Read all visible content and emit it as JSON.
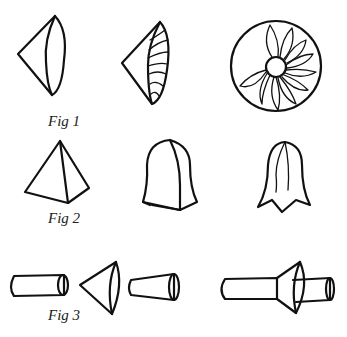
{
  "figures": [
    {
      "id": "fig1",
      "caption": "Fig 1",
      "parts": [
        "cone",
        "cone-with-petals",
        "flower-disc"
      ]
    },
    {
      "id": "fig2",
      "caption": "Fig 2",
      "parts": [
        "pyramid",
        "bell-blank",
        "bell-cut"
      ]
    },
    {
      "id": "fig3",
      "caption": "Fig 3",
      "parts": [
        "cylinder",
        "cone",
        "tapered-tube",
        "assembled-flower"
      ]
    }
  ],
  "colors": {
    "ink": "#111111",
    "paper": "#ffffff"
  }
}
